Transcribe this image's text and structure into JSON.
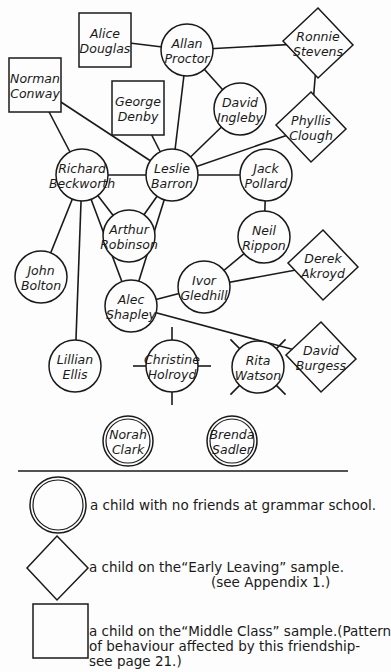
{
  "colors": {
    "ink": "#1a1a1a",
    "paper": "#fdfdfd"
  },
  "nodes": [
    {
      "id": "alice",
      "line1": "Alice",
      "line2": "Douglas",
      "shape": "square",
      "x": 105,
      "y": 40
    },
    {
      "id": "allan",
      "line1": "Allan",
      "line2": "Proctor",
      "shape": "circle",
      "x": 187,
      "y": 50
    },
    {
      "id": "ronnie",
      "line1": "Ronnie",
      "line2": "Stevens",
      "shape": "diamond",
      "x": 318,
      "y": 43
    },
    {
      "id": "norman",
      "line1": "Norman",
      "line2": "Conway",
      "shape": "square",
      "x": 35,
      "y": 85
    },
    {
      "id": "george",
      "line1": "George",
      "line2": "Denby",
      "shape": "square",
      "x": 138,
      "y": 108
    },
    {
      "id": "david_i",
      "line1": "David",
      "line2": "Ingleby",
      "shape": "circle",
      "x": 240,
      "y": 109
    },
    {
      "id": "phyllis",
      "line1": "Phyllis",
      "line2": "Clough",
      "shape": "diamond",
      "x": 311,
      "y": 127
    },
    {
      "id": "richard",
      "line1": "Richard",
      "line2": "Beckworth",
      "shape": "circle",
      "x": 82,
      "y": 175
    },
    {
      "id": "leslie",
      "line1": "Leslie",
      "line2": "Barron",
      "shape": "circle",
      "x": 172,
      "y": 175
    },
    {
      "id": "jack",
      "line1": "Jack",
      "line2": "Pollard",
      "shape": "circle",
      "x": 266,
      "y": 175
    },
    {
      "id": "arthur",
      "line1": "Arthur",
      "line2": "Robinson",
      "shape": "circle",
      "x": 129,
      "y": 236
    },
    {
      "id": "neil",
      "line1": "Neil",
      "line2": "Rippon",
      "shape": "circle",
      "x": 264,
      "y": 237
    },
    {
      "id": "derek",
      "line1": "Derek",
      "line2": "Akroyd",
      "shape": "diamond",
      "x": 323,
      "y": 265
    },
    {
      "id": "john",
      "line1": "John",
      "line2": "Bolton",
      "shape": "circle",
      "x": 41,
      "y": 277
    },
    {
      "id": "ivor",
      "line1": "Ivor",
      "line2": "Gledhill",
      "shape": "circle",
      "x": 204,
      "y": 287
    },
    {
      "id": "alec",
      "line1": "Alec",
      "line2": "Shapley",
      "shape": "circle",
      "x": 131,
      "y": 306
    },
    {
      "id": "lillian",
      "line1": "Lillian",
      "line2": "Ellis",
      "shape": "circle",
      "x": 75,
      "y": 366
    },
    {
      "id": "christine",
      "line1": "Christine",
      "line2": "Holroyd",
      "shape": "circle-plus",
      "x": 172,
      "y": 366
    },
    {
      "id": "rita",
      "line1": "Rita",
      "line2": "Watson",
      "shape": "circle-cross",
      "x": 258,
      "y": 367
    },
    {
      "id": "david_b",
      "line1": "David",
      "line2": "Burgess",
      "shape": "diamond",
      "x": 321,
      "y": 357
    },
    {
      "id": "norah",
      "line1": "Norah",
      "line2": "Clark",
      "shape": "double-circle",
      "x": 128,
      "y": 441
    },
    {
      "id": "brenda",
      "line1": "Brenda",
      "line2": "Sadler",
      "shape": "double-circle",
      "x": 232,
      "y": 441
    }
  ],
  "edges": [
    [
      "alice",
      "allan"
    ],
    [
      "allan",
      "ronnie"
    ],
    [
      "allan",
      "david_i"
    ],
    [
      "allan",
      "leslie"
    ],
    [
      "ronnie",
      "phyllis"
    ],
    [
      "phyllis",
      "leslie"
    ],
    [
      "david_i",
      "leslie"
    ],
    [
      "george",
      "leslie"
    ],
    [
      "norman",
      "leslie"
    ],
    [
      "norman",
      "richard"
    ],
    [
      "richard",
      "leslie"
    ],
    [
      "leslie",
      "jack"
    ],
    [
      "leslie",
      "arthur"
    ],
    [
      "leslie",
      "alec"
    ],
    [
      "richard",
      "arthur"
    ],
    [
      "richard",
      "john"
    ],
    [
      "richard",
      "lillian"
    ],
    [
      "richard",
      "alec"
    ],
    [
      "jack",
      "neil"
    ],
    [
      "neil",
      "ivor"
    ],
    [
      "ivor",
      "derek"
    ],
    [
      "ivor",
      "alec"
    ],
    [
      "alec",
      "david_b"
    ]
  ],
  "legend": {
    "no_friends": "a child with no friends at grammar school.",
    "early_leaving_line1": "a child on the“Early Leaving” sample.",
    "early_leaving_line2": "(see Appendix 1.)",
    "middle_class_line1": "a child on the“Middle Class” sample.(Pattern",
    "middle_class_line2": "of behaviour affected by this friendship-",
    "middle_class_line3": "see page 21.)"
  }
}
